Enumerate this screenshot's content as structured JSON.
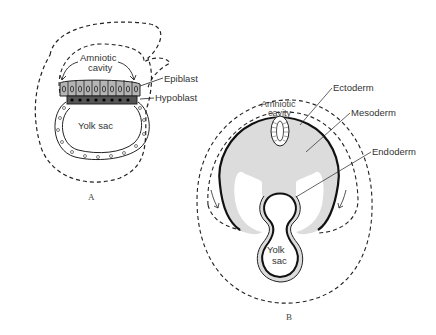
{
  "figure": {
    "panel_a": {
      "caption": "A",
      "labels": {
        "amniotic_cavity_line1": "Amniotic",
        "amniotic_cavity_line2": "cavity",
        "epiblast": "Epiblast",
        "hypoblast": "Hypoblast",
        "yolk_sac": "Yolk sac"
      }
    },
    "panel_b": {
      "caption": "B",
      "labels": {
        "amniotic_cavity_line1": "Amniotic",
        "amniotic_cavity_line2": "cavity",
        "ectoderm": "Ectoderm",
        "mesoderm": "Mesoderm",
        "endoderm": "Endoderm",
        "yolk_sac_line1": "Yolk",
        "yolk_sac_line2": "sac"
      }
    },
    "colors": {
      "line": "#222222",
      "epiblast_fill": "#b5b5b5",
      "hypoblast_fill": "#555555",
      "mesoderm_fill": "#dcdcdc",
      "background": "#ffffff"
    }
  }
}
